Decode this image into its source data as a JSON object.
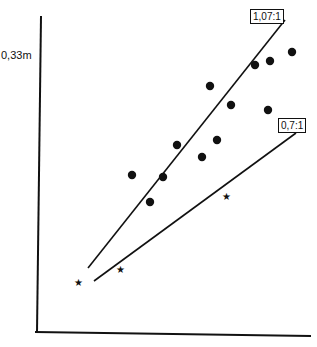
{
  "chart_data": {
    "type": "scatter",
    "title": "",
    "xlabel": "",
    "ylabel": "",
    "y_tick_labels": [
      "0,33m"
    ],
    "grid": false,
    "legend": null,
    "series": [
      {
        "name": "dots",
        "marker": "circle",
        "points_px": [
          [
            132,
            175
          ],
          [
            163,
            177
          ],
          [
            150,
            202
          ],
          [
            177,
            145
          ],
          [
            202,
            157
          ],
          [
            210,
            86
          ],
          [
            217,
            140
          ],
          [
            231,
            105
          ],
          [
            255,
            65
          ],
          [
            270,
            61
          ],
          [
            268,
            110
          ],
          [
            292,
            52
          ]
        ]
      },
      {
        "name": "stars",
        "marker": "star",
        "points_px": [
          [
            78,
            282
          ],
          [
            120,
            269
          ],
          [
            226,
            196
          ]
        ]
      }
    ],
    "regression_lines": [
      {
        "label": "1,07:1",
        "from_px": [
          88,
          268
        ],
        "to_px": [
          285,
          20
        ]
      },
      {
        "label": "0,7:1",
        "from_px": [
          94,
          281
        ],
        "to_px": [
          296,
          133
        ]
      }
    ]
  },
  "labels": {
    "y_tick": "0,33m",
    "line1": "1,07:1",
    "line2": "0,7:1"
  }
}
